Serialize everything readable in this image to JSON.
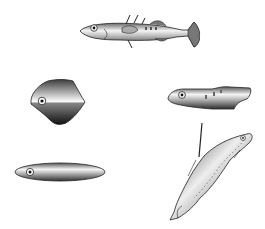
{
  "figure": {
    "items": [
      {
        "id": "stickleback",
        "label": "realistic fish with spines"
      },
      {
        "id": "diamond",
        "label": "diamond-shaped body"
      },
      {
        "id": "blocky",
        "label": "blocky elongated body"
      },
      {
        "id": "ellipse",
        "label": "elongated ellipse body"
      },
      {
        "id": "hanging",
        "label": "fish hanging from a line"
      }
    ]
  },
  "colors": {
    "background": "#ffffff",
    "body_dark": "#3a3a3a",
    "body_light": "#f2f2f2",
    "outline": "#222222"
  }
}
